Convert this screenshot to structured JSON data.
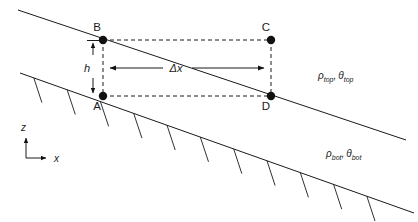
{
  "figure": {
    "points": [
      {
        "id": "A",
        "label": "A",
        "x": 103,
        "y": 96,
        "label_x": 97,
        "label_y": 110
      },
      {
        "id": "B",
        "label": "B",
        "x": 103,
        "y": 40,
        "label_x": 97,
        "label_y": 31
      },
      {
        "id": "C",
        "label": "C",
        "x": 271,
        "y": 40,
        "label_x": 266,
        "label_y": 31
      },
      {
        "id": "D",
        "label": "D",
        "x": 271,
        "y": 96,
        "label_x": 266,
        "label_y": 110
      }
    ],
    "dimensions": {
      "height_label": "h",
      "height_label_x": 87,
      "height_label_y": 72,
      "horizontal_label": "Δx",
      "horizontal_label_x": 176,
      "horizontal_label_y": 72
    },
    "region_labels": [
      {
        "id": "top-region",
        "rho": "ρ",
        "rho_sub": "top",
        "comma": ",",
        "theta": "θ",
        "theta_sub": "top",
        "x": 318,
        "y": 79
      },
      {
        "id": "bot-region",
        "rho": "ρ",
        "rho_sub": "bot",
        "comma": ",",
        "theta": "θ",
        "theta_sub": "bot",
        "x": 326,
        "y": 157
      }
    ],
    "axes": {
      "z_label": "z",
      "z_label_x": 21,
      "z_label_y": 131,
      "x_label": "x",
      "x_label_x": 54,
      "x_label_y": 163,
      "origin_x": 26,
      "origin_y": 158,
      "z_top_y": 136,
      "x_right_x": 48
    },
    "interface_top": {
      "id": "top-interface-line",
      "x1": 18,
      "y1": 10,
      "x2": 406,
      "y2": 140
    },
    "interface_bottom": {
      "id": "bottom-slope-line",
      "x1": 20,
      "y1": 73,
      "x2": 414,
      "y2": 213
    },
    "hatch_count": 11,
    "colors": {
      "line": "#1a1a1a",
      "background": "#ffffff",
      "node": "#111111"
    }
  }
}
